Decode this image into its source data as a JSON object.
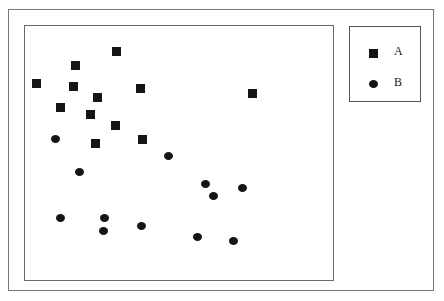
{
  "chart_data": {
    "type": "scatter",
    "title": "",
    "xlabel": "",
    "ylabel": "",
    "grid": false,
    "legend_position": "upper-right-outside",
    "series": [
      {
        "name": "A",
        "marker": "square",
        "color": "#151515",
        "points": [
          [
            116,
            51
          ],
          [
            75,
            65
          ],
          [
            36,
            83
          ],
          [
            73,
            86
          ],
          [
            97,
            97
          ],
          [
            140,
            88
          ],
          [
            252,
            93
          ],
          [
            60,
            107
          ],
          [
            90,
            114
          ],
          [
            115,
            125
          ],
          [
            95,
            143
          ],
          [
            142,
            139
          ]
        ]
      },
      {
        "name": "B",
        "marker": "circle",
        "color": "#151515",
        "points": [
          [
            55,
            139
          ],
          [
            168,
            156
          ],
          [
            79,
            172
          ],
          [
            205,
            184
          ],
          [
            242,
            188
          ],
          [
            213,
            196
          ],
          [
            60,
            218
          ],
          [
            104,
            218
          ],
          [
            103,
            231
          ],
          [
            141,
            226
          ],
          [
            197,
            237
          ],
          [
            233,
            241
          ]
        ]
      }
    ]
  },
  "legend": {
    "items": [
      {
        "label": "A",
        "marker": "square"
      },
      {
        "label": "B",
        "marker": "circle"
      }
    ]
  }
}
